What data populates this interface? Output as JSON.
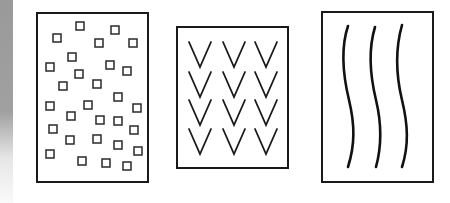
{
  "figure": {
    "panels": [
      {
        "id": "squares",
        "label": "scattered small squares",
        "box": [
          37,
          13,
          148,
          182
        ],
        "count": 29
      },
      {
        "id": "chevrons",
        "label": "grid of V shapes",
        "box": [
          177,
          27,
          288,
          168
        ],
        "rows": 4,
        "cols": 3
      },
      {
        "id": "wavy-lines",
        "label": "three vertical wavy lines",
        "box": [
          322,
          12,
          433,
          182
        ],
        "count": 3
      }
    ],
    "colors": {
      "stroke": "#1a1a1a",
      "background": "#ffffff",
      "edge": "#9a9a9a"
    },
    "squares": [
      [
        80,
        26
      ],
      [
        115,
        30
      ],
      [
        57,
        38
      ],
      [
        99,
        43
      ],
      [
        133,
        43
      ],
      [
        72,
        57
      ],
      [
        50,
        67
      ],
      [
        110,
        65
      ],
      [
        127,
        71
      ],
      [
        79,
        74
      ],
      [
        63,
        86
      ],
      [
        97,
        84
      ],
      [
        50,
        106
      ],
      [
        88,
        105
      ],
      [
        118,
        97
      ],
      [
        137,
        108
      ],
      [
        71,
        116
      ],
      [
        100,
        120
      ],
      [
        118,
        121
      ],
      [
        53,
        129
      ],
      [
        134,
        130
      ],
      [
        70,
        140
      ],
      [
        97,
        139
      ],
      [
        118,
        145
      ],
      [
        50,
        154
      ],
      [
        82,
        161
      ],
      [
        106,
        163
      ],
      [
        127,
        166
      ],
      [
        138,
        151
      ]
    ]
  }
}
